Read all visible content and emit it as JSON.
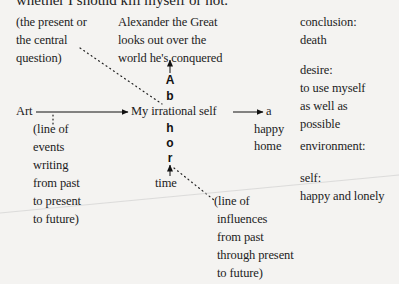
{
  "header": {
    "cut_off_text": "whether I should kill myself or not."
  },
  "diagram": {
    "top_left_note": [
      "(the present or",
      "the central",
      "question)"
    ],
    "top_center_note": [
      "Alexander the Great",
      "looks out over the",
      "world he's conquered"
    ],
    "left_node": "Art",
    "center_node": "My irrational self",
    "right_node": [
      "a",
      "happy",
      "home"
    ],
    "vertical_letters": [
      "A",
      "b",
      "h",
      "o",
      "r"
    ],
    "bottom_center_node": "time",
    "left_dotted_note": [
      "(line of",
      "events",
      "writing",
      "from past",
      "to present",
      "to future)"
    ],
    "bottom_dotted_note": [
      "(line of",
      "influences",
      "from past",
      "through present",
      "to future)"
    ]
  },
  "right_column": {
    "conclusion_label": "conclusion:",
    "conclusion_value": "death",
    "desire_label": "desire:",
    "desire_value": [
      "to use myself",
      "as well as",
      "possible"
    ],
    "environment_label": "environment:",
    "self_label": "self:",
    "self_value": "happy and lonely"
  },
  "colors": {
    "paper": "#f4f3f1",
    "ink": "#1c1c1c"
  }
}
